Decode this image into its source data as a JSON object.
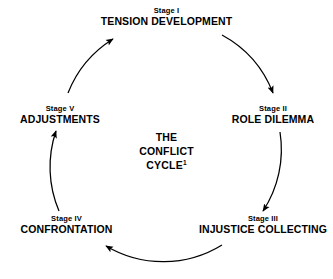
{
  "diagram": {
    "center_title": {
      "line1": "THE",
      "line2": "CONFLICT",
      "line3": "CYCLE",
      "footnote_marker": "1"
    },
    "stroke_color": "#000000",
    "text_color": "#000000",
    "background_color": "#ffffff",
    "stages": [
      {
        "number": "Stage I",
        "name": "TENSION DEVELOPMENT"
      },
      {
        "number": "Stage II",
        "name": "ROLE DILEMMA"
      },
      {
        "number": "Stage III",
        "name": "INJUSTICE COLLECTING"
      },
      {
        "number": "Stage IV",
        "name": "CONFRONTATION"
      },
      {
        "number": "Stage V",
        "name": "ADJUSTMENTS"
      }
    ]
  }
}
